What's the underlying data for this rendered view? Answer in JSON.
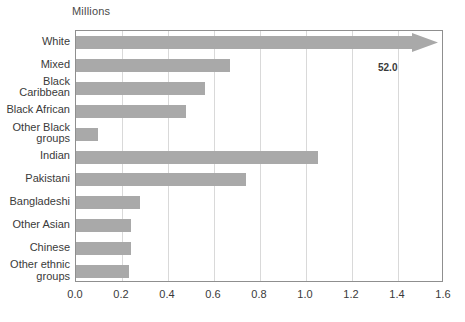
{
  "chart_data": {
    "type": "bar",
    "orientation": "horizontal",
    "title": "",
    "subtitle": "",
    "axis_unit_label": "Millions",
    "xlabel": "",
    "ylabel": "",
    "xlim": [
      0.0,
      1.6
    ],
    "xticks": [
      "0.0",
      "0.2",
      "0.4",
      "0.6",
      "0.8",
      "1.0",
      "1.2",
      "1.4",
      "1.6"
    ],
    "xtick_values": [
      0.0,
      0.2,
      0.4,
      0.6,
      0.8,
      1.0,
      1.2,
      1.4,
      1.6
    ],
    "grid": true,
    "grid_axis": "x",
    "legend": false,
    "bar_color": "#a9a9a9",
    "frame_color": "#8f8f8f",
    "gridline_color": "#d9d9d9",
    "text_color": "#3a3a3a",
    "categories": [
      "White",
      "Mixed",
      "Black\nCaribbean",
      "Black African",
      "Other Black\ngroups",
      "Indian",
      "Pakistani",
      "Bangladeshi",
      "Other Asian",
      "Chinese",
      "Other ethnic\ngroups"
    ],
    "values": [
      52.0,
      0.67,
      0.56,
      0.48,
      0.095,
      1.05,
      0.74,
      0.28,
      0.24,
      0.24,
      0.23
    ],
    "annotations": [
      {
        "text": "52.0",
        "category": "White",
        "note": "White bar is broken off-scale and drawn as an arrow reaching past the axis maximum"
      }
    ],
    "bars": [
      {
        "label": "White",
        "value": 52.0,
        "display_value": "52.0",
        "off_scale": true,
        "clipped_label": false
      },
      {
        "label": "Mixed",
        "value": 0.67,
        "display_value": "",
        "off_scale": false,
        "clipped_label": false
      },
      {
        "label": "Black\nCaribbean",
        "value": 0.56,
        "display_value": "",
        "off_scale": false,
        "clipped_label": false
      },
      {
        "label": "Black African",
        "value": 0.48,
        "display_value": "",
        "off_scale": false,
        "clipped_label": true
      },
      {
        "label": "Other Black\ngroups",
        "value": 0.095,
        "display_value": "",
        "off_scale": false,
        "clipped_label": false
      },
      {
        "label": "Indian",
        "value": 1.05,
        "display_value": "",
        "off_scale": false,
        "clipped_label": false
      },
      {
        "label": "Pakistani",
        "value": 0.74,
        "display_value": "",
        "off_scale": false,
        "clipped_label": false
      },
      {
        "label": "Bangladeshi",
        "value": 0.28,
        "display_value": "",
        "off_scale": false,
        "clipped_label": true
      },
      {
        "label": "Other Asian",
        "value": 0.24,
        "display_value": "",
        "off_scale": false,
        "clipped_label": true
      },
      {
        "label": "Chinese",
        "value": 0.24,
        "display_value": "",
        "off_scale": false,
        "clipped_label": false
      },
      {
        "label": "Other ethnic\ngroups",
        "value": 0.23,
        "display_value": "",
        "off_scale": false,
        "clipped_label": true
      }
    ]
  }
}
